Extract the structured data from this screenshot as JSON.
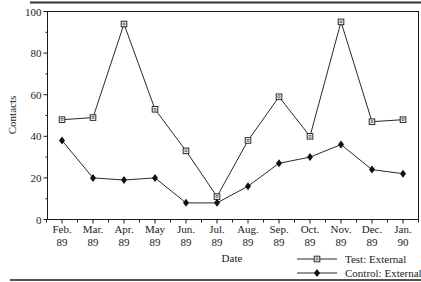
{
  "chart_data": {
    "type": "line",
    "title": "",
    "xlabel": "Date",
    "ylabel": "Contacts",
    "ylim": [
      0,
      100
    ],
    "yticks": [
      0,
      20,
      40,
      60,
      80,
      100
    ],
    "categories": [
      "Feb. 89",
      "Mar. 89",
      "Apr. 89",
      "May 89",
      "Jun. 89",
      "Jul. 89",
      "Aug. 89",
      "Sep. 89",
      "Oct. 89",
      "Nov. 89",
      "Dec. 89",
      "Jan. 90"
    ],
    "category_lines": [
      [
        "Feb.",
        "89"
      ],
      [
        "Mar.",
        "89"
      ],
      [
        "Apr.",
        "89"
      ],
      [
        "May",
        "89"
      ],
      [
        "Jun.",
        "89"
      ],
      [
        "Jul.",
        "89"
      ],
      [
        "Aug.",
        "89"
      ],
      [
        "Sep.",
        "89"
      ],
      [
        "Oct.",
        "89"
      ],
      [
        "Nov.",
        "89"
      ],
      [
        "Dec.",
        "89"
      ],
      [
        "Jan.",
        "90"
      ]
    ],
    "series": [
      {
        "name": "Test: External",
        "marker": "open-square",
        "values": [
          48,
          49,
          94,
          53,
          33,
          11,
          38,
          59,
          40,
          95,
          47,
          48
        ]
      },
      {
        "name": "Control: External",
        "marker": "filled-diamond",
        "values": [
          38,
          20,
          19,
          20,
          8,
          8,
          16,
          27,
          30,
          36,
          24,
          22
        ]
      }
    ],
    "grid": false,
    "legend_position": "bottom-right"
  },
  "colors": {
    "line": "#2a2a2a",
    "frame": "#1a1a1a",
    "rule": "#333333"
  }
}
